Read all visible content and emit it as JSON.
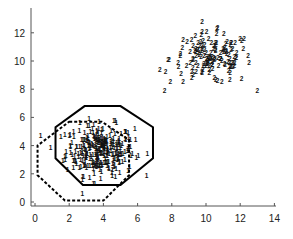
{
  "chart_data": {
    "type": "scatter",
    "title": "",
    "xlabel": "",
    "ylabel": "",
    "xlim": [
      -0.2,
      14
    ],
    "ylim": [
      -0.3,
      13.8
    ],
    "x_ticks": [
      0,
      2,
      4,
      6,
      8,
      10,
      12,
      14
    ],
    "y_ticks": [
      0,
      2,
      4,
      6,
      8,
      10,
      12
    ],
    "grid": false,
    "legend": null,
    "series": [
      {
        "name": "class 1",
        "marker_label": "1",
        "center": [
          3.8,
          3.5
        ],
        "spread": [
          1.0,
          0.9
        ],
        "count": 300,
        "x_range": [
          0.3,
          6.9
        ],
        "y_range": [
          0.4,
          6.1
        ]
      },
      {
        "name": "class 2",
        "marker_label": "2",
        "center": [
          10.3,
          10.0
        ],
        "spread": [
          1.2,
          0.9
        ],
        "count": 150,
        "x_range": [
          7.3,
          13.2
        ],
        "y_range": [
          7.6,
          12.6
        ]
      }
    ],
    "annotations": [
      {
        "name": "solid-octagon",
        "style": "solid",
        "vertices": [
          [
            2.9,
            6.8
          ],
          [
            5.0,
            6.8
          ],
          [
            6.9,
            5.3
          ],
          [
            6.9,
            3.1
          ],
          [
            5.0,
            1.2
          ],
          [
            2.8,
            1.2
          ],
          [
            1.2,
            3.1
          ],
          [
            1.2,
            5.3
          ]
        ]
      },
      {
        "name": "dashed-octagon",
        "style": "dashed",
        "vertices": [
          [
            2.0,
            5.7
          ],
          [
            3.9,
            5.7
          ],
          [
            5.5,
            4.4
          ],
          [
            5.5,
            1.9
          ],
          [
            4.0,
            0.1
          ],
          [
            1.75,
            0.1
          ],
          [
            0.15,
            1.9
          ],
          [
            0.15,
            4.0
          ]
        ]
      }
    ]
  },
  "axes": {
    "x_tick_labels": [
      "0",
      "2",
      "4",
      "6",
      "8",
      "10",
      "12",
      "14"
    ],
    "y_tick_labels": [
      "0",
      "2",
      "4",
      "6",
      "8",
      "10",
      "12"
    ]
  }
}
